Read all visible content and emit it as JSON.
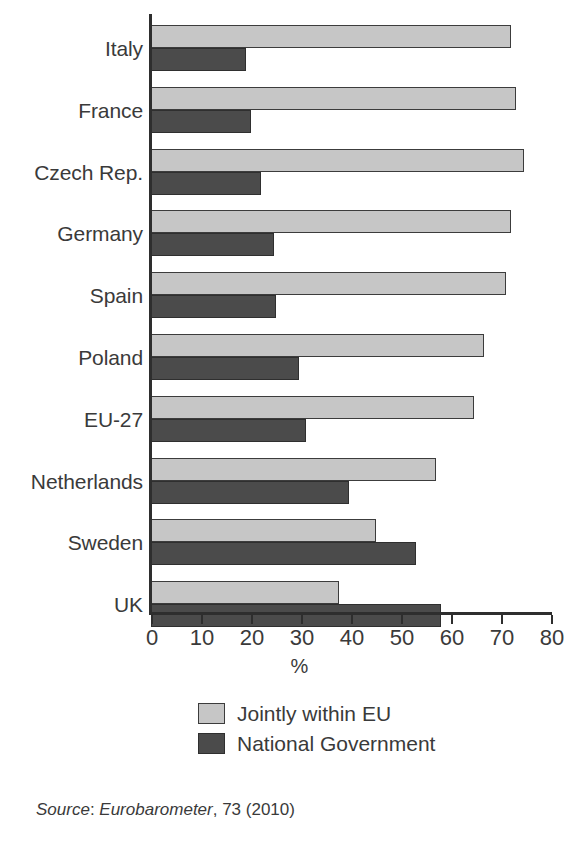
{
  "chart_data": {
    "type": "bar",
    "orientation": "horizontal",
    "title": "",
    "xlabel": "%",
    "ylabel": "",
    "xlim": [
      0,
      80
    ],
    "xticks": [
      0,
      10,
      20,
      30,
      40,
      50,
      60,
      70,
      80
    ],
    "xtick_labels": [
      "0",
      "10",
      "20",
      "30",
      "40",
      "50",
      "60",
      "70",
      "80"
    ],
    "grid": false,
    "legend_position": "bottom-center",
    "categories": [
      "Italy",
      "France",
      "Czech Rep.",
      "Germany",
      "Spain",
      "Poland",
      "EU-27",
      "Netherlands",
      "Sweden",
      "UK"
    ],
    "series": [
      {
        "name": "Jointly within EU",
        "color": "#c6c6c6",
        "values": [
          72,
          73,
          74.5,
          72,
          71,
          66.5,
          64.5,
          57,
          45,
          37.5
        ]
      },
      {
        "name": "National Government",
        "color": "#4b4b4b",
        "values": [
          19,
          20,
          22,
          24.5,
          25,
          29.5,
          31,
          39.5,
          53,
          58
        ]
      }
    ]
  },
  "legend": {
    "items": [
      {
        "label": "Jointly within EU",
        "swatch": "light"
      },
      {
        "label": "National Government",
        "swatch": "dark"
      }
    ]
  },
  "source": {
    "prefix": "Source",
    "separator": ": ",
    "publication": "Eurobarometer",
    "details": ", 73 (2010)"
  },
  "colors": {
    "light_bar": "#c6c6c6",
    "dark_bar": "#4b4b4b",
    "axis": "#2e2e2e",
    "text": "#3a3a3a",
    "background": "#ffffff"
  }
}
